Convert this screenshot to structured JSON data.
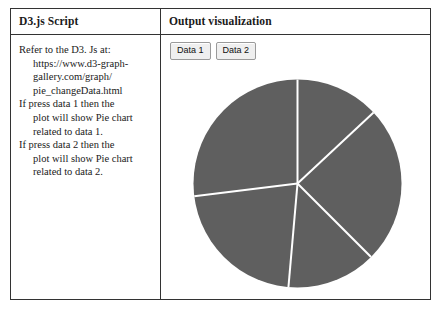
{
  "table": {
    "headers": {
      "left": "D3.js Script",
      "right": "Output visualization"
    }
  },
  "script_cell": {
    "lines": [
      {
        "lead": "Refer to the D3. Js at:",
        "continuations": [
          "https://www.d3-graph-",
          "gallery.com/graph/",
          "pie_changeData.html"
        ]
      },
      {
        "lead": "If press data 1 then the",
        "continuations": [
          "plot will show Pie chart",
          "related to data 1."
        ]
      },
      {
        "lead": "If press data 2 then the",
        "continuations": [
          "plot will show Pie chart",
          "related to data 2."
        ]
      }
    ]
  },
  "visualization": {
    "buttons": [
      {
        "label": "Data 1",
        "name": "data-1-button"
      },
      {
        "label": "Data 2",
        "name": "data-2-button"
      }
    ]
  },
  "chart_data": {
    "type": "pie",
    "title": "",
    "slice_color": "#5f5f5f",
    "separator_color": "#ffffff",
    "separator_width": 2,
    "center_x": 298,
    "center_y": 183,
    "radius": 104,
    "start_angle_deg": 0,
    "categories": [
      "a",
      "b",
      "c",
      "d",
      "e"
    ],
    "values": [
      13,
      24,
      36,
      14,
      13
    ],
    "boundaries_deg": [
      0,
      47,
      135,
      185,
      263,
      360
    ],
    "legend": "none",
    "labels_shown": false
  }
}
